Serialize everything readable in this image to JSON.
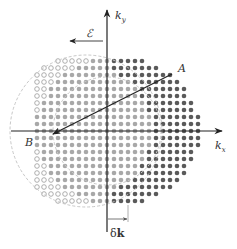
{
  "diagram": {
    "axes": {
      "x_label": "k",
      "x_sub": "x",
      "y_label": "k",
      "y_sub": "y",
      "origin": [
        107,
        131
      ]
    },
    "field": {
      "symbol": "ℰ",
      "direction": "left"
    },
    "points": {
      "A": "A",
      "B": "B"
    },
    "shift": {
      "delta_symbol": "δ",
      "k_symbol": "k"
    },
    "grid": {
      "spacing": 7,
      "original_circle": {
        "cx": 107,
        "cy": 131,
        "r": 76
      },
      "shifted_circle": {
        "cx": 128,
        "cy": 131,
        "r": 76
      },
      "colors": {
        "occupied": "#a8a8a8",
        "added": "#5a5a5a",
        "removed_outline": "#9a9a9a",
        "axis": "#222222",
        "circle": "#bbbbbb"
      }
    }
  }
}
